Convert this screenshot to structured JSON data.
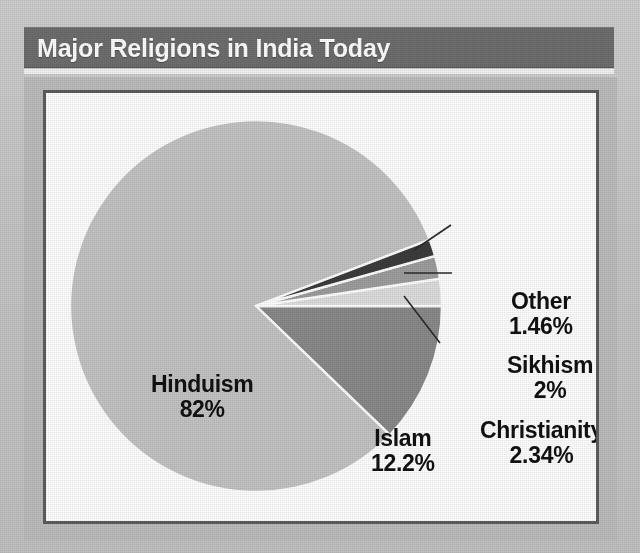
{
  "page": {
    "background_color": "#c9c9c9",
    "panel_color": "#ffffff",
    "frame_color": "#bdbdbd",
    "keyline_color": "#5d5d5d"
  },
  "header": {
    "title": "Major Religions in India Today",
    "bar_color": "#6e6e6e",
    "text_color": "#ffffff"
  },
  "chart_data": {
    "type": "pie",
    "title": "Major Religions in India Today",
    "xlabel": "",
    "ylabel": "",
    "grid": false,
    "legend_position": "none",
    "units": "percent",
    "total": 100,
    "start_angle_deg": 0,
    "direction": "counterclockwise",
    "center": {
      "x": 210,
      "y": 213
    },
    "radius": 186,
    "categories": [
      "Hinduism",
      "Islam",
      "Christianity",
      "Sikhism",
      "Other"
    ],
    "values": [
      82,
      12.2,
      2.34,
      2,
      1.46
    ],
    "value_labels": [
      "82%",
      "12.2%",
      "2.34%",
      "2%",
      "1.46%"
    ],
    "colors": [
      "#c4c4c4",
      "#8a8a8a",
      "#dedede",
      "#9e9e9e",
      "#3c3c3c"
    ],
    "slices": [
      {
        "name": "Hinduism",
        "value": 82,
        "value_label": "82%",
        "color": "#c4c4c4",
        "label_position": "inside-left",
        "has_leader_line": false
      },
      {
        "name": "Islam",
        "value": 12.2,
        "value_label": "12.2%",
        "color": "#8a8a8a",
        "label_position": "inside-right",
        "has_leader_line": false
      },
      {
        "name": "Christianity",
        "value": 2.34,
        "value_label": "2.34%",
        "color": "#dedede",
        "label_position": "outside-right",
        "has_leader_line": true
      },
      {
        "name": "Sikhism",
        "value": 2,
        "value_label": "2%",
        "color": "#9e9e9e",
        "label_position": "outside-right",
        "has_leader_line": true
      },
      {
        "name": "Other",
        "value": 1.46,
        "value_label": "1.46%",
        "color": "#3c3c3c",
        "label_position": "outside-right",
        "has_leader_line": true
      }
    ]
  }
}
